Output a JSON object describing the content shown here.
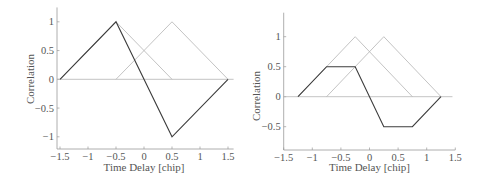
{
  "chart_data": [
    {
      "type": "line",
      "title": "",
      "xlabel": "Time Delay  [chip]",
      "ylabel": "Correlation",
      "xlim": [
        -1.55,
        1.6
      ],
      "ylim": [
        -1.2,
        1.25
      ],
      "xticks": [
        -1.5,
        -1,
        -0.5,
        0,
        0.5,
        1,
        1.5
      ],
      "xtick_labels": [
        "−1.5",
        "−1",
        "−0.5",
        "0",
        "0.5",
        "1",
        "1.5"
      ],
      "yticks": [
        -1,
        -0.5,
        0,
        0.5,
        1
      ],
      "ytick_labels": [
        "−1",
        "−0.5",
        "0",
        "0.5",
        "1"
      ],
      "grid": false,
      "legend": null,
      "zero_line": {
        "x": [
          -1.55,
          1.6
        ],
        "y": [
          0,
          0
        ]
      },
      "series": [
        {
          "name": "early correlation",
          "color": "#b4b4b4",
          "x": [
            -1.5,
            -0.5,
            0.5
          ],
          "y": [
            0,
            1,
            0
          ]
        },
        {
          "name": "late correlation",
          "color": "#b4b4b4",
          "x": [
            -0.5,
            0.5,
            1.5
          ],
          "y": [
            0,
            1,
            0
          ]
        },
        {
          "name": "early minus late discriminator",
          "color": "#3c3c3c",
          "x": [
            -1.5,
            -0.5,
            0.5,
            1.5
          ],
          "y": [
            0,
            1,
            -1,
            0
          ]
        }
      ]
    },
    {
      "type": "line",
      "title": "",
      "xlabel": "Time Delay  [chip]",
      "ylabel": "Correlation",
      "xlim": [
        -1.5,
        1.5
      ],
      "ylim": [
        -0.88,
        1.4
      ],
      "xticks": [
        -1.5,
        -1,
        -0.5,
        0,
        0.5,
        1,
        1.5
      ],
      "xtick_labels": [
        "−1.5",
        "−1",
        "−0.5",
        "0",
        "0.5",
        "1",
        "1.5"
      ],
      "yticks": [
        -0.5,
        0,
        0.5,
        1
      ],
      "ytick_labels": [
        "−0.5",
        "0",
        "0.5",
        "1"
      ],
      "grid": false,
      "legend": null,
      "zero_line": {
        "x": [
          -1.5,
          1.45
        ],
        "y": [
          0,
          0
        ]
      },
      "series": [
        {
          "name": "early correlation",
          "color": "#b4b4b4",
          "x": [
            -1.25,
            -0.25,
            0.75
          ],
          "y": [
            0,
            1,
            0
          ]
        },
        {
          "name": "late correlation",
          "color": "#b4b4b4",
          "x": [
            -0.75,
            0.25,
            1.25
          ],
          "y": [
            0,
            1,
            0
          ]
        },
        {
          "name": "early minus late discriminator",
          "color": "#3c3c3c",
          "x": [
            -1.25,
            -0.75,
            -0.25,
            0.25,
            0.75,
            1.25
          ],
          "y": [
            0,
            0.5,
            0.5,
            -0.5,
            -0.5,
            0
          ]
        }
      ]
    }
  ],
  "layout": [
    {
      "axis_left": 57,
      "axis_bottom": 149,
      "x0_px": 144,
      "px_per_x": 56,
      "y0_px": 79.3,
      "px_per_y": 57.5
    },
    {
      "axis_left": 41.7,
      "axis_bottom": 150,
      "x0_px": 127.5,
      "px_per_x": 57.2,
      "y0_px": 96.7,
      "px_per_y": 60
    }
  ],
  "colors": {
    "axis": "#9a9a9a",
    "zero_line": "#b4b4b4",
    "text": "#555555"
  }
}
